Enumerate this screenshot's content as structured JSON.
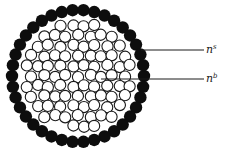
{
  "diagram": {
    "labels": [
      {
        "id": "surface",
        "base": "n",
        "superscript": "s",
        "refers_to": "surface atoms (filled circles)"
      },
      {
        "id": "bulk",
        "base": "n",
        "superscript": "b",
        "refers_to": "bulk atoms (open circles)"
      }
    ],
    "colors": {
      "surface_atom": "#0d0d0d",
      "bulk_atom_fill": "#ffffff",
      "bulk_atom_stroke": "#1a1a1a",
      "line": "#1a1a1a"
    }
  }
}
